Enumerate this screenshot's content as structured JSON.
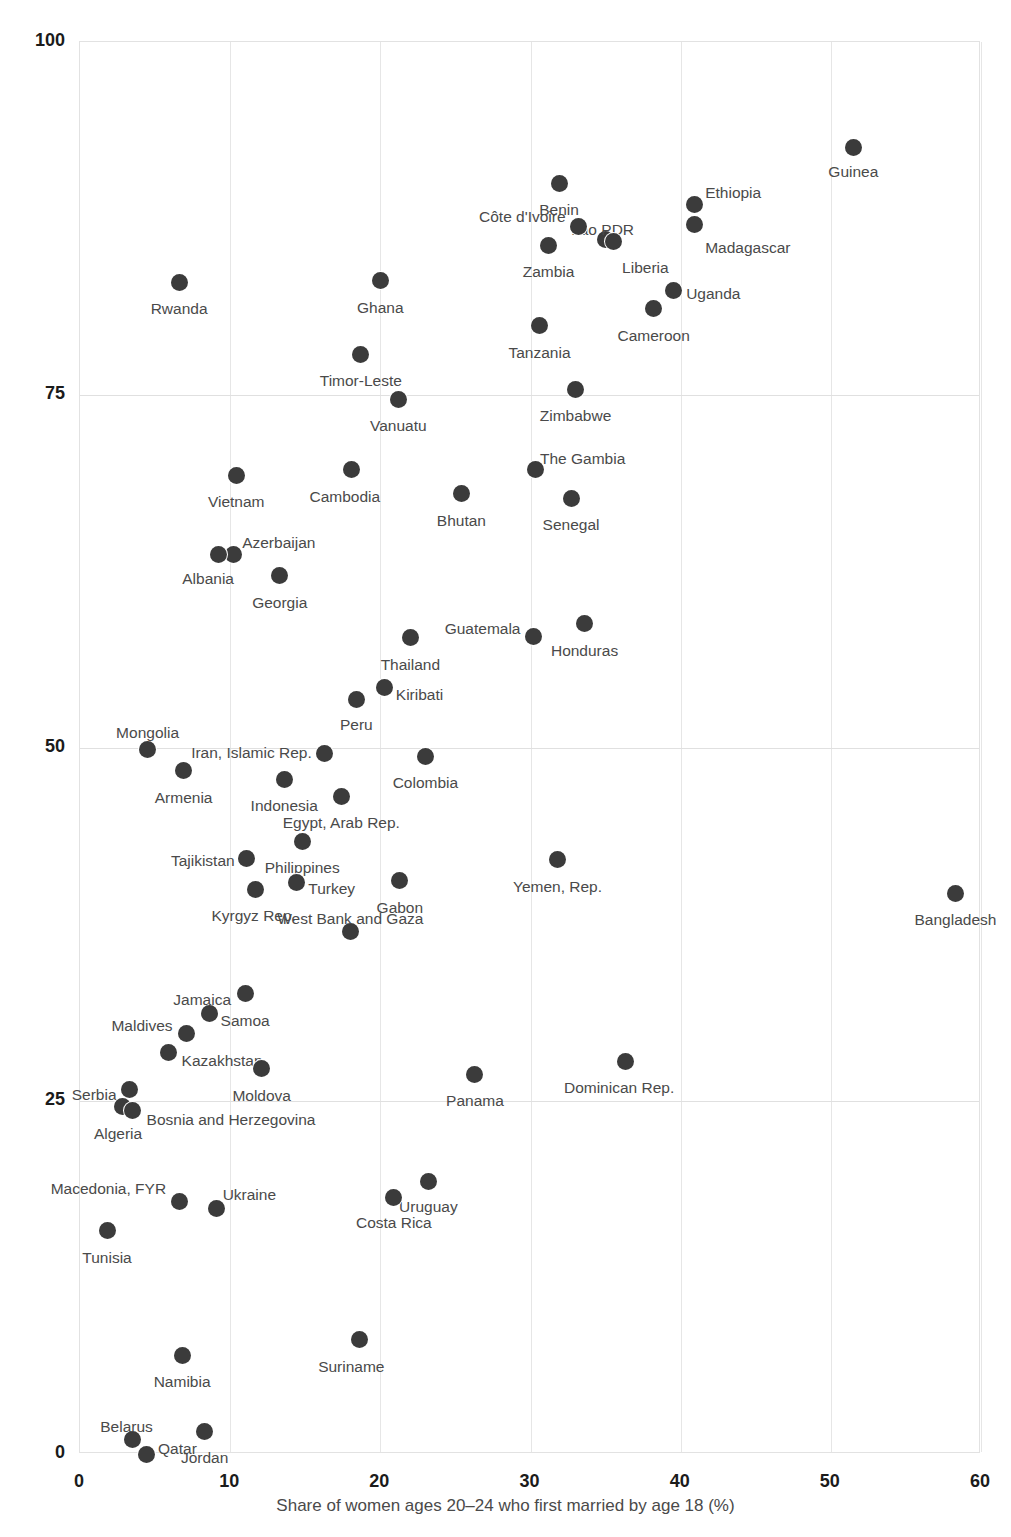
{
  "top_clipped_text": "",
  "axes": {
    "x": {
      "label": "Share of women ages 20–24 who first married by age 18 (%)",
      "ticks": [
        "0",
        "10",
        "20",
        "30",
        "40",
        "50",
        "60"
      ],
      "min": 0,
      "max": 60
    },
    "y": {
      "label": "",
      "ticks": [
        "0",
        "25",
        "50",
        "75",
        "100"
      ],
      "min": 0,
      "max": 100
    }
  },
  "style": {
    "dot_color": "#3b3b3b",
    "grid_color": "#e6e6e6",
    "label_color": "#4a4a4a",
    "tick_color": "#1b1b1b",
    "background": "#ffffff"
  },
  "chart_data": {
    "type": "scatter",
    "title": "",
    "xlabel": "Share of women ages 20–24 who first married by age 18 (%)",
    "ylabel": "",
    "xlim": [
      0,
      60
    ],
    "ylim": [
      0,
      100
    ],
    "xticks": [
      0,
      10,
      20,
      30,
      40,
      50,
      60
    ],
    "yticks": [
      0,
      25,
      50,
      75,
      100
    ],
    "grid": true,
    "legend": "none",
    "points": [
      {
        "label": "Guinea",
        "x": 51.5,
        "y": 92.5,
        "lx": 0,
        "ly": 23,
        "anchor": "middle"
      },
      {
        "label": "Benin",
        "x": 31.9,
        "y": 90.0,
        "lx": 0,
        "ly": 26,
        "anchor": "middle"
      },
      {
        "label": "Ethiopia",
        "x": 40.9,
        "y": 88.5,
        "lx": 11,
        "ly": -12,
        "anchor": "start"
      },
      {
        "label": "Lao PDR",
        "x": 35.0,
        "y": 86.0,
        "lx": -3,
        "ly": -11,
        "anchor": "middle"
      },
      {
        "label": "Madagascar",
        "x": 40.9,
        "y": 87.1,
        "lx": 11,
        "ly": 23,
        "anchor": "start"
      },
      {
        "label": "Côte d'Ivoire",
        "x": 33.2,
        "y": 86.9,
        "lx": -13,
        "ly": -11,
        "anchor": "end"
      },
      {
        "label": "Liberia",
        "x": 35.5,
        "y": 85.9,
        "lx": 9,
        "ly": 26,
        "anchor": "start"
      },
      {
        "label": "Zambia",
        "x": 31.2,
        "y": 85.6,
        "lx": 0,
        "ly": 26,
        "anchor": "middle"
      },
      {
        "label": "Uganda",
        "x": 39.5,
        "y": 82.4,
        "lx": 13,
        "ly": 2,
        "anchor": "start"
      },
      {
        "label": "Rwanda",
        "x": 6.6,
        "y": 83.0,
        "lx": 0,
        "ly": 26,
        "anchor": "middle"
      },
      {
        "label": "Ghana",
        "x": 20.0,
        "y": 83.1,
        "lx": 0,
        "ly": 26,
        "anchor": "middle"
      },
      {
        "label": "Cameroon",
        "x": 38.2,
        "y": 81.1,
        "lx": 0,
        "ly": 26,
        "anchor": "middle"
      },
      {
        "label": "Tanzania",
        "x": 30.6,
        "y": 79.9,
        "lx": 0,
        "ly": 26,
        "anchor": "middle"
      },
      {
        "label": "Timor-Leste",
        "x": 18.7,
        "y": 77.9,
        "lx": 0,
        "ly": 26,
        "anchor": "middle"
      },
      {
        "label": "Zimbabwe",
        "x": 33.0,
        "y": 75.4,
        "lx": 0,
        "ly": 26,
        "anchor": "middle"
      },
      {
        "label": "Vanuatu",
        "x": 21.2,
        "y": 74.7,
        "lx": 0,
        "ly": 26,
        "anchor": "middle"
      },
      {
        "label": "The Gambia",
        "x": 30.3,
        "y": 69.7,
        "lx": 5,
        "ly": -12,
        "anchor": "start"
      },
      {
        "label": "Cambodia",
        "x": 18.1,
        "y": 69.7,
        "lx": -7,
        "ly": 26,
        "anchor": "middle"
      },
      {
        "label": "Vietnam",
        "x": 10.4,
        "y": 69.3,
        "lx": 0,
        "ly": 26,
        "anchor": "middle"
      },
      {
        "label": "Senegal",
        "x": 32.7,
        "y": 67.7,
        "lx": 0,
        "ly": 26,
        "anchor": "middle"
      },
      {
        "label": "Bhutan",
        "x": 25.4,
        "y": 68.0,
        "lx": 0,
        "ly": 26,
        "anchor": "middle"
      },
      {
        "label": "Azerbaijan",
        "x": 10.2,
        "y": 63.7,
        "lx": 9,
        "ly": -13,
        "anchor": "start"
      },
      {
        "label": "Albania",
        "x": 9.2,
        "y": 63.7,
        "lx": -10,
        "ly": 23,
        "anchor": "middle"
      },
      {
        "label": "Georgia",
        "x": 13.3,
        "y": 62.2,
        "lx": 0,
        "ly": 26,
        "anchor": "middle"
      },
      {
        "label": "Thailand",
        "x": 22.0,
        "y": 57.8,
        "lx": 0,
        "ly": 26,
        "anchor": "middle"
      },
      {
        "label": "Honduras",
        "x": 33.6,
        "y": 58.8,
        "lx": 0,
        "ly": 26,
        "anchor": "middle"
      },
      {
        "label": "Guatemala",
        "x": 30.2,
        "y": 57.9,
        "lx": -13,
        "ly": -8,
        "anchor": "end"
      },
      {
        "label": "Kiribati",
        "x": 20.3,
        "y": 54.3,
        "lx": 11,
        "ly": 7,
        "anchor": "start"
      },
      {
        "label": "Peru",
        "x": 18.4,
        "y": 53.4,
        "lx": 0,
        "ly": 24,
        "anchor": "middle"
      },
      {
        "label": "Mongolia",
        "x": 4.5,
        "y": 49.9,
        "lx": 0,
        "ly": -17,
        "anchor": "middle"
      },
      {
        "label": "Iran, Islamic Rep.",
        "x": 16.3,
        "y": 49.6,
        "lx": -13,
        "ly": -2,
        "anchor": "end"
      },
      {
        "label": "Colombia",
        "x": 23.0,
        "y": 49.4,
        "lx": 0,
        "ly": 26,
        "anchor": "middle"
      },
      {
        "label": "Armenia",
        "x": 6.9,
        "y": 48.4,
        "lx": 0,
        "ly": 26,
        "anchor": "middle"
      },
      {
        "label": "Indonesia",
        "x": 13.6,
        "y": 47.8,
        "lx": 0,
        "ly": 26,
        "anchor": "middle"
      },
      {
        "label": "Egypt, Arab Rep.",
        "x": 17.4,
        "y": 46.6,
        "lx": 0,
        "ly": 26,
        "anchor": "middle"
      },
      {
        "label": "Philippines",
        "x": 14.8,
        "y": 43.4,
        "lx": 0,
        "ly": 26,
        "anchor": "middle"
      },
      {
        "label": "Tajikistan",
        "x": 11.1,
        "y": 42.2,
        "lx": -12,
        "ly": 2,
        "anchor": "end"
      },
      {
        "label": "Yemen, Rep.",
        "x": 31.8,
        "y": 42.1,
        "lx": 0,
        "ly": 26,
        "anchor": "middle"
      },
      {
        "label": "Turkey",
        "x": 14.4,
        "y": 40.5,
        "lx": 12,
        "ly": 6,
        "anchor": "start"
      },
      {
        "label": "Kyrgyz Rep.",
        "x": 11.7,
        "y": 40.0,
        "lx": -2,
        "ly": 26,
        "anchor": "middle"
      },
      {
        "label": "Gabon",
        "x": 21.3,
        "y": 40.6,
        "lx": 0,
        "ly": 26,
        "anchor": "middle"
      },
      {
        "label": "Bangladesh",
        "x": 58.3,
        "y": 39.7,
        "lx": 0,
        "ly": 26,
        "anchor": "middle"
      },
      {
        "label": "West Bank and Gaza",
        "x": 18.0,
        "y": 37.0,
        "lx": 0,
        "ly": -14,
        "anchor": "middle"
      },
      {
        "label": "Samoa",
        "x": 11.0,
        "y": 32.6,
        "lx": 0,
        "ly": 26,
        "anchor": "middle"
      },
      {
        "label": "Jamaica",
        "x": 8.6,
        "y": 31.2,
        "lx": -7,
        "ly": -14,
        "anchor": "middle"
      },
      {
        "label": "Maldives",
        "x": 7.1,
        "y": 29.8,
        "lx": -14,
        "ly": -8,
        "anchor": "end"
      },
      {
        "label": "Kazakhstan",
        "x": 5.9,
        "y": 28.4,
        "lx": 13,
        "ly": 7,
        "anchor": "start"
      },
      {
        "label": "Dominican Rep.",
        "x": 36.3,
        "y": 27.8,
        "lx": -6,
        "ly": 26,
        "anchor": "middle"
      },
      {
        "label": "Moldova",
        "x": 12.1,
        "y": 27.3,
        "lx": 0,
        "ly": 26,
        "anchor": "middle"
      },
      {
        "label": "Panama",
        "x": 26.3,
        "y": 26.9,
        "lx": 0,
        "ly": 26,
        "anchor": "middle"
      },
      {
        "label": "Serbia",
        "x": 3.3,
        "y": 25.8,
        "lx": -13,
        "ly": 4,
        "anchor": "end"
      },
      {
        "label": "Algeria",
        "x": 2.8,
        "y": 24.6,
        "lx": -4,
        "ly": 26,
        "anchor": "middle"
      },
      {
        "label": "Bosnia and Herzegovina",
        "x": 3.5,
        "y": 24.3,
        "lx": 14,
        "ly": 8,
        "anchor": "start"
      },
      {
        "label": "Uruguay",
        "x": 23.2,
        "y": 19.3,
        "lx": 0,
        "ly": 25,
        "anchor": "middle"
      },
      {
        "label": "Costa Rica",
        "x": 20.9,
        "y": 18.2,
        "lx": 0,
        "ly": 25,
        "anchor": "middle"
      },
      {
        "label": "Macedonia, FYR",
        "x": 6.6,
        "y": 17.9,
        "lx": -13,
        "ly": -13,
        "anchor": "end"
      },
      {
        "label": "Ukraine",
        "x": 9.1,
        "y": 17.4,
        "lx": 6,
        "ly": -14,
        "anchor": "start"
      },
      {
        "label": "Tunisia",
        "x": 1.8,
        "y": 15.8,
        "lx": 0,
        "ly": 26,
        "anchor": "middle"
      },
      {
        "label": "Suriname",
        "x": 18.6,
        "y": 8.1,
        "lx": -8,
        "ly": 26,
        "anchor": "middle"
      },
      {
        "label": "Namibia",
        "x": 6.8,
        "y": 7.0,
        "lx": 0,
        "ly": 26,
        "anchor": "middle"
      },
      {
        "label": "Jordan",
        "x": 8.3,
        "y": 1.6,
        "lx": 0,
        "ly": 26,
        "anchor": "middle"
      },
      {
        "label": "Belarus",
        "x": 3.5,
        "y": 1.0,
        "lx": -6,
        "ly": -14,
        "anchor": "middle"
      },
      {
        "label": "Qatar",
        "x": 4.4,
        "y": 0.0,
        "lx": 12,
        "ly": -6,
        "anchor": "start"
      }
    ]
  }
}
